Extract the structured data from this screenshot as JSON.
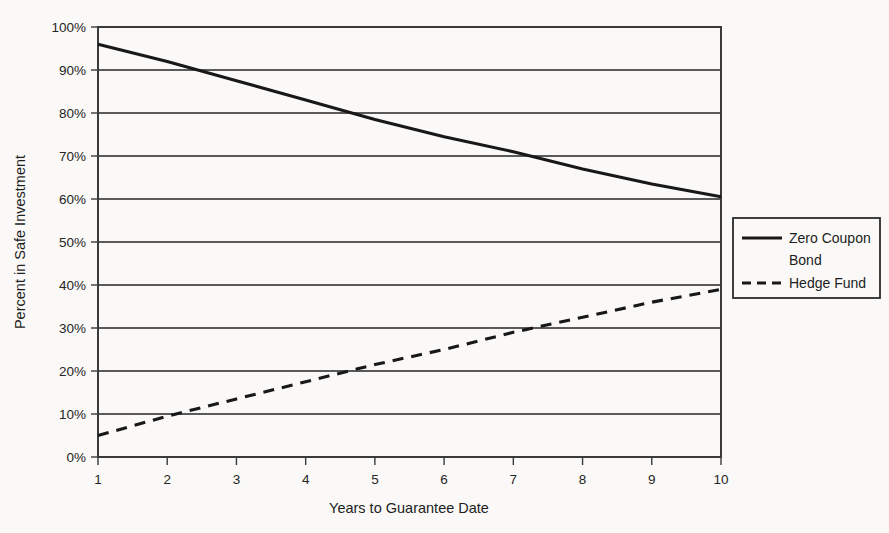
{
  "chart_data": {
    "type": "line",
    "title": "",
    "xlabel": "Years to Guarantee Date",
    "ylabel": "Percent in Safe Investment",
    "x": [
      1,
      2,
      3,
      4,
      5,
      6,
      7,
      8,
      9,
      10
    ],
    "xlim": [
      1,
      10
    ],
    "ylim": [
      0,
      100
    ],
    "xticks": [
      "1",
      "2",
      "3",
      "4",
      "5",
      "6",
      "7",
      "8",
      "9",
      "10"
    ],
    "yticks": [
      "0%",
      "10%",
      "20%",
      "30%",
      "40%",
      "50%",
      "60%",
      "70%",
      "80%",
      "90%",
      "100%"
    ],
    "ytick_values": [
      0,
      10,
      20,
      30,
      40,
      50,
      60,
      70,
      80,
      90,
      100
    ],
    "grid": "horizontal",
    "legend_position": "right-middle",
    "series": [
      {
        "name": "Zero Coupon Bond",
        "style": "solid",
        "color": "#181818",
        "values": [
          96,
          92,
          87.5,
          83,
          78.5,
          74.5,
          71,
          67,
          63.5,
          60.5
        ]
      },
      {
        "name": "Hedge Fund",
        "style": "dashed",
        "color": "#181818",
        "values": [
          5,
          9.5,
          13.5,
          17.5,
          21.5,
          25,
          29,
          32.5,
          36,
          39
        ]
      }
    ]
  },
  "legend": {
    "entries": [
      {
        "label_line1": "Zero Coupon",
        "label_line2": "Bond",
        "style": "solid"
      },
      {
        "label_line1": "Hedge Fund",
        "label_line2": "",
        "style": "dashed"
      }
    ]
  },
  "axes": {
    "y_title": "Percent in Safe Investment",
    "x_title": "Years to Guarantee Date"
  },
  "colors": {
    "background": "#faf9f7",
    "line": "#181818",
    "grid": "#5a5a5a",
    "frame": "#3a3a3a",
    "text": "#1d1d1d"
  }
}
